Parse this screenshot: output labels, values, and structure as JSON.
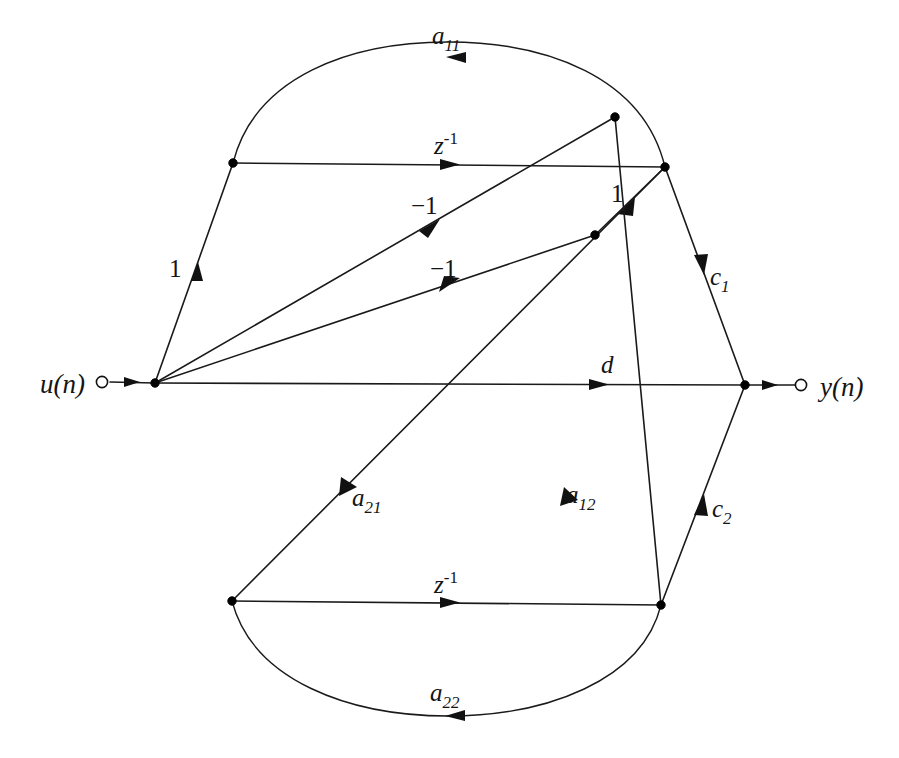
{
  "figure": {
    "type": "signal-flow-graph",
    "title": "",
    "background_color": "#ffffff",
    "line_color": "#1a1a1a",
    "text_color": "#141414",
    "width": 899,
    "height": 758
  },
  "terminals": {
    "input": {
      "label": "u(n)",
      "label_x": 40,
      "label_y": 392,
      "circle_x": 102,
      "circle_y": 382,
      "circle_r": 6
    },
    "output": {
      "label": "y(n)",
      "label_x": 822,
      "label_y": 395,
      "circle_x": 801,
      "circle_y": 385,
      "circle_r": 6
    }
  },
  "nodes": [
    {
      "id": "n-input-sum",
      "name": "input-summing-node",
      "x": 155,
      "y": 383
    },
    {
      "id": "n-upper-left",
      "name": "upper-delay-input-node",
      "x": 233,
      "y": 163
    },
    {
      "id": "n-upper-right",
      "name": "upper-delay-output-node",
      "x": 665,
      "y": 167
    },
    {
      "id": "n-upper-arc",
      "name": "upper-feedback-branch-node",
      "x": 615,
      "y": 117
    },
    {
      "id": "n-mid-branch",
      "name": "second-state-branch-node",
      "x": 595,
      "y": 235
    },
    {
      "id": "n-lower-left",
      "name": "lower-delay-input-node",
      "x": 232,
      "y": 601
    },
    {
      "id": "n-lower-right",
      "name": "lower-delay-output-node",
      "x": 661,
      "y": 605
    },
    {
      "id": "n-output-sum",
      "name": "output-summing-node",
      "x": 745,
      "y": 385
    }
  ],
  "edges": [
    {
      "id": "e-input-feed",
      "name": "input-feed-edge",
      "from": "u(n)",
      "to": "input-summing-node",
      "label": "",
      "label_sub": "",
      "path": "M 110 382 L 155 383",
      "arrow": {
        "x": 131,
        "y": 382,
        "angle": 0
      }
    },
    {
      "id": "e-gain-1-up",
      "name": "gain-one-to-upper-delay-edge",
      "from": "input-summing-node",
      "to": "upper-delay-input-node",
      "label": "1",
      "label_x": 170,
      "label_y": 275,
      "path": "M 155 383 L 233 163",
      "arrow": {
        "x": 196,
        "y": 268,
        "angle": -70.5
      }
    },
    {
      "id": "e-upper-delay",
      "name": "upper-unit-delay-edge",
      "from": "upper-delay-input-node",
      "to": "upper-delay-output-node",
      "label": "z",
      "label_sup": "-1",
      "label_x": 432,
      "label_y": 154,
      "path": "M 233 163 L 665 167",
      "arrow": {
        "x": 452,
        "y": 165,
        "angle": 0.5
      }
    },
    {
      "id": "e-a11",
      "name": "a11-feedback-arc",
      "from": "upper-delay-output-node",
      "to": "upper-delay-input-node",
      "label": "a",
      "label_sub": "11",
      "label_x": 432,
      "label_y": 43,
      "path": "M 665 167 C 640 70, 540 42, 448 42 C 356 42, 258 70, 233 163",
      "arrow": {
        "x": 455,
        "y": 57,
        "angle": 184
      }
    },
    {
      "id": "e-minus1-upper",
      "name": "minus-one-upper-edge",
      "from": "input-summing-node",
      "to": "upper-feedback-branch-node",
      "label": "-1",
      "label_x": 414,
      "label_y": 212,
      "path": "M 155 383 L 615 117",
      "arrow": {
        "x": 428,
        "y": 225,
        "angle": -30.0
      }
    },
    {
      "id": "e-minus1-lower",
      "name": "minus-one-lower-edge",
      "from": "input-summing-node",
      "to": "second-state-branch-node",
      "label": "-1",
      "label_x": 432,
      "label_y": 275,
      "path": "M 155 383 L 595 235",
      "arrow": {
        "x": 448,
        "y": 284,
        "angle": -18.6
      }
    },
    {
      "id": "e-gain-1-right",
      "name": "gain-one-to-upper-delay-output-edge",
      "from": "second-state-branch-node",
      "to": "upper-delay-output-node",
      "label": "1",
      "label_x": 612,
      "label_y": 200,
      "path": "M 595 235 L 665 167",
      "arrow": {
        "x": 626,
        "y": 205,
        "angle": -44.2
      }
    },
    {
      "id": "e-c1",
      "name": "c1-output-edge",
      "from": "upper-delay-output-node",
      "to": "output-summing-node",
      "label": "c",
      "label_sub": "1",
      "label_x": 709,
      "label_y": 284,
      "path": "M 665 167 L 745 385",
      "arrow": {
        "x": 702,
        "y": 268,
        "angle": 69.9
      }
    },
    {
      "id": "e-d",
      "name": "d-feedthrough-edge",
      "from": "input-summing-node",
      "to": "output-summing-node",
      "label": "d",
      "label_x": 602,
      "label_y": 372,
      "path": "M 155 383 L 745 385",
      "arrow": {
        "x": 601,
        "y": 385,
        "angle": 0.2
      }
    },
    {
      "id": "e-a21",
      "name": "a21-cross-edge",
      "from": "upper-delay-output-node",
      "to": "lower-delay-input-node",
      "label": "a",
      "label_sub": "21",
      "label_x": 352,
      "label_y": 505,
      "path": "M 665 167 L 232 601",
      "arrow": {
        "x": 348,
        "y": 486,
        "angle": 135.0
      }
    },
    {
      "id": "e-a12",
      "name": "a12-cross-edge",
      "from": "lower-delay-output-node",
      "to": "upper-feedback-branch-node",
      "label": "a",
      "label_sub": "12",
      "label_x": 566,
      "label_y": 503,
      "path": "M 661 605 L 615 117",
      "arrow": {
        "x": 569,
        "y": 495,
        "angle": -95.4,
        "reverse": true
      }
    },
    {
      "id": "e-lower-delay",
      "name": "lower-unit-delay-edge",
      "from": "lower-delay-input-node",
      "to": "lower-delay-output-node",
      "label": "z",
      "label_sup": "-1",
      "label_x": 432,
      "label_y": 592,
      "path": "M 232 601 L 661 605",
      "arrow": {
        "x": 452,
        "y": 603,
        "angle": 0.5
      }
    },
    {
      "id": "e-a22",
      "name": "a22-feedback-arc",
      "from": "lower-delay-output-node",
      "to": "lower-delay-input-node",
      "label": "a",
      "label_sub": "22",
      "label_x": 432,
      "label_y": 700,
      "path": "M 661 605 C 640 690, 545 716, 448 716 C 350 716, 255 690, 232 601",
      "arrow": {
        "x": 452,
        "y": 716,
        "angle": 181
      }
    },
    {
      "id": "e-c2",
      "name": "c2-output-edge",
      "from": "lower-delay-output-node",
      "to": "output-summing-node",
      "label": "c",
      "label_sub": "2",
      "label_x": 712,
      "label_y": 516,
      "path": "M 661 605 L 745 385",
      "arrow": {
        "x": 702,
        "y": 497,
        "angle": -69.1
      }
    },
    {
      "id": "e-output-feed",
      "name": "output-feed-edge",
      "from": "output-summing-node",
      "to": "y(n)",
      "label": "",
      "path": "M 745 385 L 795 385",
      "arrow": {
        "x": 771,
        "y": 385,
        "angle": 0
      }
    }
  ],
  "gains": {
    "a11": "a",
    "a11_sub": "11",
    "a12": "a",
    "a12_sub": "12",
    "a21": "a",
    "a21_sub": "21",
    "a22": "a",
    "a22_sub": "22",
    "c1": "c",
    "c1_sub": "1",
    "c2": "c",
    "c2_sub": "2",
    "d": "d",
    "delay": "z",
    "delay_sup": "-1",
    "one_left": "1",
    "one_right": "1",
    "minus_one_upper": "−1",
    "minus_one_lower": "−1"
  }
}
